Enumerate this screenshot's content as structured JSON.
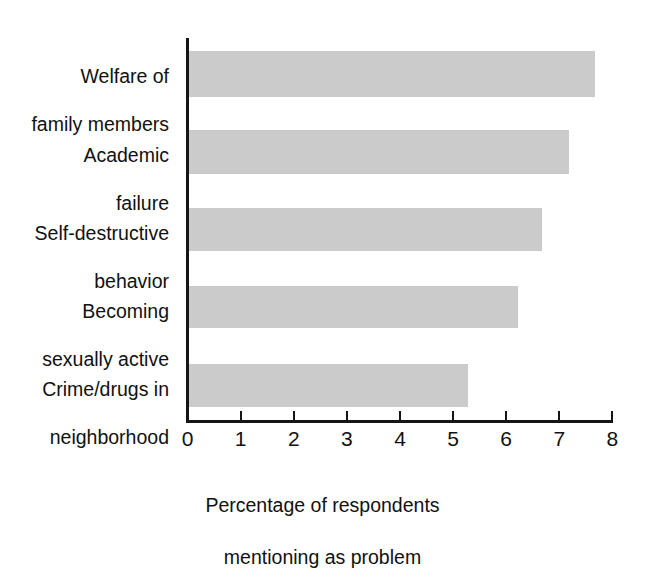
{
  "chart_data": {
    "type": "bar",
    "orientation": "horizontal",
    "title": "",
    "subtitle": "",
    "xlabel": "Percentage of respondents mentioning as problem",
    "xlabel_line1": "Percentage of respondents",
    "xlabel_line2": "mentioning as problem",
    "ylabel": "",
    "categories": [
      "Welfare of family members",
      "Academic failure",
      "Self-destructive behavior",
      "Becoming sexually active",
      "Crime/drugs in neighborhood"
    ],
    "category_lines": [
      [
        "Welfare of",
        "family members"
      ],
      [
        "Academic",
        "failure"
      ],
      [
        "Self-destructive",
        "behavior"
      ],
      [
        "Becoming",
        "sexually active"
      ],
      [
        "Crime/drugs in",
        "neighborhood"
      ]
    ],
    "values": [
      7.65,
      7.15,
      6.65,
      6.2,
      5.25
    ],
    "xlim": [
      0,
      8
    ],
    "xticks": [
      0,
      1,
      2,
      3,
      4,
      5,
      6,
      7,
      8
    ],
    "xtick_labels": [
      "0",
      "1",
      "2",
      "3",
      "4",
      "5",
      "6",
      "7",
      "8"
    ],
    "grid": false,
    "legend": false,
    "bar_color": "#cbcbcb",
    "axis_color": "#151515",
    "background_color": "#ffffff"
  }
}
